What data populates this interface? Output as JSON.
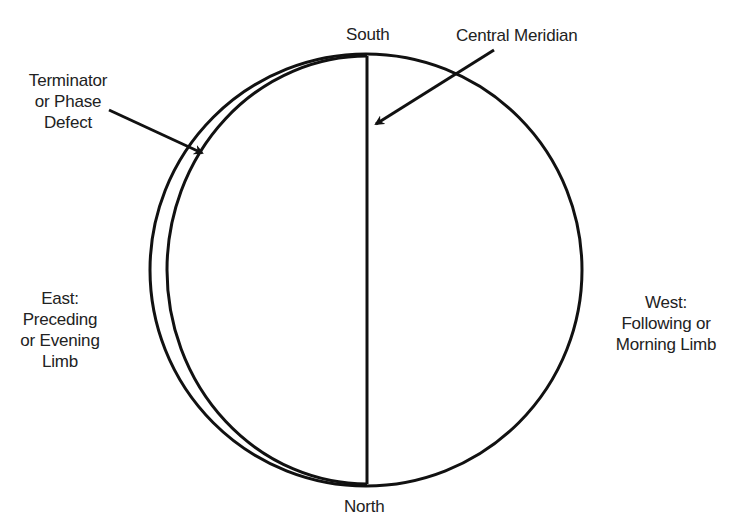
{
  "labels": {
    "south": "South",
    "north": "North",
    "central_meridian": "Central Meridian",
    "terminator": [
      "Terminator",
      "or Phase",
      "Defect"
    ],
    "east": [
      "East:",
      "Preceding",
      "or Evening",
      "Limb"
    ],
    "west": [
      "West:",
      "Following or",
      "Morning Limb"
    ]
  },
  "geometry": {
    "disk": {
      "cx": 366,
      "cy": 270,
      "r": 216
    },
    "terminator_ellipse": {
      "cx": 367,
      "cy": 270,
      "rx": 200,
      "ry": 214
    },
    "meridian": {
      "x": 367,
      "y1": 56,
      "y2": 484
    },
    "terminator_arrow": {
      "x1": 109,
      "y1": 110,
      "x2": 202,
      "y2": 153
    },
    "meridian_arrow": {
      "x1": 494,
      "y1": 50,
      "x2": 376,
      "y2": 124
    }
  },
  "colors": {
    "line": "#111111",
    "background": "#ffffff",
    "text": "#222222"
  }
}
